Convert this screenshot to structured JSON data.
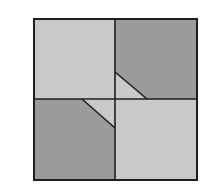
{
  "diagram": {
    "colors": {
      "background": "#ffffff",
      "light": "#c9c9c9",
      "dark": "#9b9b9b",
      "line": "#1e1e1e"
    },
    "outer": {
      "x1": 34,
      "y1": 19,
      "x2": 197,
      "y2": 180
    },
    "center": {
      "x": 115,
      "y": 99
    },
    "quadrants": [
      {
        "name": "top-left",
        "shade": "light"
      },
      {
        "name": "top-right",
        "shade": "dark"
      },
      {
        "name": "bottom-left",
        "shade": "dark"
      },
      {
        "name": "bottom-right",
        "shade": "light"
      }
    ],
    "diagonals": [
      {
        "name": "top-right-cut",
        "from": [
          115,
          72
        ],
        "to": [
          147,
          99
        ]
      },
      {
        "name": "bottom-left-cut",
        "from": [
          82,
          99
        ],
        "to": [
          115,
          128
        ]
      }
    ]
  }
}
